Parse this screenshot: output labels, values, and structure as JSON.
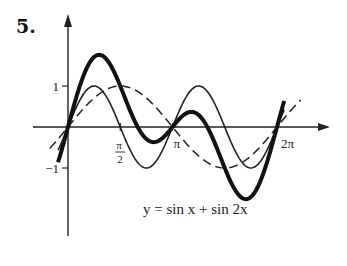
{
  "figure": {
    "number_label": "5."
  },
  "chart_data": {
    "type": "line",
    "title": "",
    "equation_label": "y = sin x + sin 2x",
    "xlabel": "",
    "ylabel": "",
    "x_ticks": [
      {
        "value": 1.5708,
        "label": "π/2"
      },
      {
        "value": 3.1416,
        "label": "π"
      },
      {
        "value": 6.2832,
        "label": "2π"
      }
    ],
    "y_ticks": [
      {
        "value": 1,
        "label": "1"
      },
      {
        "value": -1,
        "label": "−1"
      }
    ],
    "xlim": [
      -0.33,
      6.8
    ],
    "ylim": [
      -2.6,
      2.7
    ],
    "grid": false,
    "legend": null,
    "series": [
      {
        "name": "sin x",
        "style": "dashed",
        "expr": "sin(x)",
        "x_range": [
          -0.55,
          7.0
        ],
        "x": [
          0,
          0.785,
          1.571,
          2.356,
          3.142,
          3.927,
          4.712,
          5.498,
          6.283
        ],
        "values": [
          0,
          0.707,
          1,
          0.707,
          0,
          -0.707,
          -1,
          -0.707,
          0
        ]
      },
      {
        "name": "sin 2x",
        "style": "thin",
        "expr": "sin(2x)",
        "x_range": [
          -0.3,
          6.5
        ],
        "x": [
          0,
          0.785,
          1.571,
          2.356,
          3.142,
          3.927,
          4.712,
          5.498,
          6.283
        ],
        "values": [
          0,
          1,
          0,
          -1,
          0,
          1,
          0,
          -1,
          0
        ]
      },
      {
        "name": "sin x + sin 2x",
        "style": "thick",
        "expr": "sin(x)+sin(2x)",
        "x_range": [
          -0.3,
          6.5
        ],
        "x": [
          0,
          0.785,
          0.936,
          1.571,
          2.356,
          2.57,
          3.142,
          3.713,
          3.927,
          4.712,
          5.347,
          5.498,
          6.283
        ],
        "values": [
          0,
          1.707,
          1.76,
          1,
          -0.293,
          -0.37,
          0,
          0.37,
          0.293,
          -1,
          -1.76,
          -1.707,
          0
        ]
      }
    ]
  },
  "colors": {
    "ink": "#111111",
    "background": "#ffffff"
  }
}
